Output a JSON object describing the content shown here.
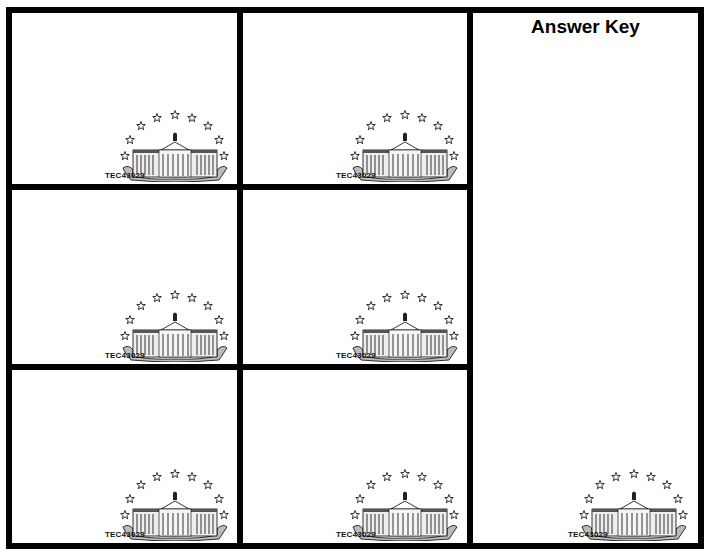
{
  "sheet": {
    "answer_key": {
      "title": "Answer Key",
      "code": "TEC43029",
      "icon": "white-house-icon"
    },
    "cards": [
      {
        "code": "TEC43029",
        "icon": "white-house-icon"
      },
      {
        "code": "TEC43029",
        "icon": "white-house-icon"
      },
      {
        "code": "TEC43029",
        "icon": "white-house-icon"
      },
      {
        "code": "TEC43029",
        "icon": "white-house-icon"
      },
      {
        "code": "TEC43029",
        "icon": "white-house-icon"
      },
      {
        "code": "TEC43029",
        "icon": "white-house-icon"
      }
    ]
  },
  "colors": {
    "border": "#000000",
    "background": "#ffffff"
  }
}
